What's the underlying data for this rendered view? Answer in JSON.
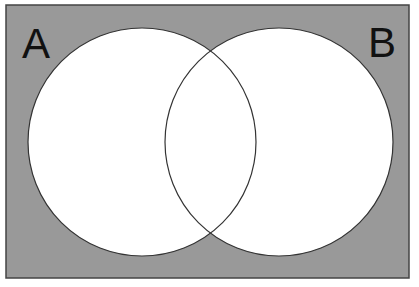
{
  "diagram": {
    "type": "venn",
    "sets": [
      {
        "label": "A",
        "cx": 142,
        "cy": 142,
        "r": 114
      },
      {
        "label": "B",
        "cx": 279,
        "cy": 142,
        "r": 114
      }
    ],
    "colors": {
      "background": "#999999",
      "circle_fill": "#ffffff",
      "stroke": "#333333",
      "frame": "#444444",
      "label": "#111111"
    }
  }
}
